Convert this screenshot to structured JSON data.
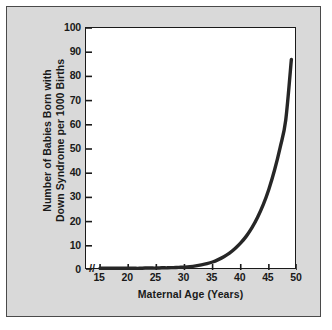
{
  "figure": {
    "background_color": "#d9d9d9",
    "plot_background_color": "#ffffff",
    "frame_color": "#4a4a4a",
    "axis_color": "#1a1a1a",
    "curve_color": "#262626",
    "axis_break_symbol": "//"
  },
  "chart_data": {
    "type": "line",
    "title": "",
    "subtitle": "",
    "xlabel": "Maternal Age (Years)",
    "ylabel_line1": "Number of Babies Born with",
    "ylabel_line2": "Down Syndrome per 1000 Births",
    "ylabel": "Number of Babies Born with Down Syndrome per 1000 Births",
    "xlim": [
      12.5,
      50
    ],
    "ylim": [
      0,
      100
    ],
    "xticks": [
      15,
      20,
      25,
      30,
      35,
      40,
      45,
      50
    ],
    "yticks": [
      0,
      10,
      20,
      30,
      40,
      50,
      60,
      70,
      80,
      90,
      100
    ],
    "xtick_labels": [
      "15",
      "20",
      "25",
      "30",
      "35",
      "40",
      "45",
      "50"
    ],
    "ytick_labels": [
      "0",
      "10",
      "20",
      "30",
      "40",
      "50",
      "60",
      "70",
      "80",
      "90",
      "100"
    ],
    "grid": false,
    "legend": false,
    "legend_position": "none",
    "axis_break_on_x": true,
    "series": [
      {
        "name": "Down syndrome incidence per 1000 births",
        "x": [
          15,
          16,
          17,
          18,
          19,
          20,
          21,
          22,
          23,
          24,
          25,
          26,
          27,
          28,
          29,
          30,
          31,
          32,
          33,
          34,
          35,
          36,
          37,
          38,
          39,
          40,
          41,
          42,
          43,
          44,
          45,
          46,
          47,
          48,
          49
        ],
        "values": [
          0.7,
          0.7,
          0.7,
          0.7,
          0.7,
          0.7,
          0.7,
          0.7,
          0.8,
          0.8,
          0.8,
          0.9,
          0.9,
          1.0,
          1.1,
          1.2,
          1.4,
          1.7,
          2.1,
          2.6,
          3.3,
          4.3,
          5.5,
          7.0,
          8.9,
          11.2,
          14.0,
          17.5,
          21.8,
          27.0,
          33.4,
          41.2,
          50.6,
          62.0,
          87.0
        ]
      }
    ]
  },
  "xticks_display": [
    {
      "label": "15",
      "value": 15
    },
    {
      "label": "20",
      "value": 20
    },
    {
      "label": "25",
      "value": 25
    },
    {
      "label": "30",
      "value": 30
    },
    {
      "label": "35",
      "value": 35
    },
    {
      "label": "40",
      "value": 40
    },
    {
      "label": "45",
      "value": 45
    },
    {
      "label": "50",
      "value": 50
    }
  ],
  "yticks_display": [
    {
      "label": "100",
      "value": 100
    },
    {
      "label": "90",
      "value": 90
    },
    {
      "label": "80",
      "value": 80
    },
    {
      "label": "70",
      "value": 70
    },
    {
      "label": "60",
      "value": 60
    },
    {
      "label": "50",
      "value": 50
    },
    {
      "label": "40",
      "value": 40
    },
    {
      "label": "30",
      "value": 30
    },
    {
      "label": "20",
      "value": 20
    },
    {
      "label": "10",
      "value": 10
    },
    {
      "label": "0",
      "value": 0
    }
  ]
}
